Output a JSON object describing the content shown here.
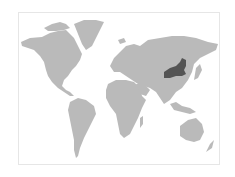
{
  "map": {
    "type": "world-locator-map",
    "projection": "robinson-like",
    "highlighted_region": "Inner Mongolia",
    "colors": {
      "background": "#ffffff",
      "frame": "#e6e6e6",
      "land": "#bababa",
      "highlight": "#545454"
    },
    "frame": {
      "x": 18,
      "y": 12,
      "width": 202,
      "height": 153
    }
  }
}
